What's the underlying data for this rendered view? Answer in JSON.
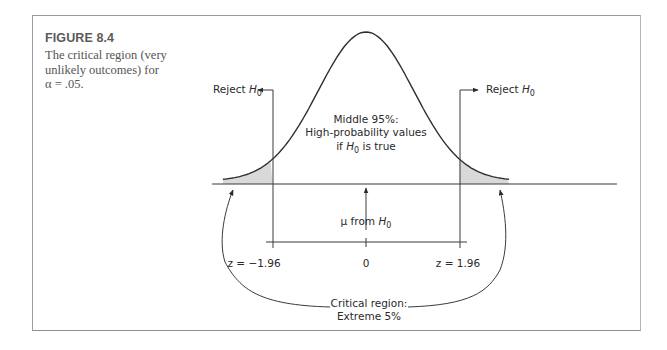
{
  "figure": {
    "number": "FIGURE 8.4",
    "caption_lines": [
      "The critical region (very",
      "unlikely outcomes) for",
      "α = .05."
    ]
  },
  "labels": {
    "reject_left": "Reject ",
    "reject_right": "Reject ",
    "h": "H",
    "sub0": "0",
    "middle_line1": "Middle 95%:",
    "middle_line2": "High-probability values",
    "middle_line3_pre": "if ",
    "middle_line3_post": " is true",
    "mu_pre": "μ from ",
    "z_left": "z = −1.96",
    "zero": "0",
    "z_right": "z = 1.96",
    "critical_line1": "Critical region:",
    "critical_line2": "Extreme 5%"
  },
  "colors": {
    "curve": "#2f2f2f",
    "shade": "#d9d9d9",
    "axis": "#3a3a3a"
  },
  "chart_data": {
    "type": "area",
    "title": "The critical region (very unlikely outcomes) for α = .05",
    "distribution": "standard normal",
    "mean": 0,
    "critical_values": [
      -1.96,
      1.96
    ],
    "alpha": 0.05,
    "tick_labels": [
      "z = −1.96",
      "0",
      "z = 1.96"
    ],
    "regions": [
      {
        "name": "Reject H0 (left tail)",
        "range": [
          -3.0,
          -1.96
        ],
        "shaded": true
      },
      {
        "name": "Middle 95%: High-probability values if H0 is true",
        "range": [
          -1.96,
          1.96
        ],
        "shaded": false
      },
      {
        "name": "Reject H0 (right tail)",
        "range": [
          1.96,
          3.0
        ],
        "shaded": true
      }
    ],
    "annotations": [
      "Reject H0",
      "Middle 95%: High-probability values if H0 is true",
      "μ from H0",
      "Critical region: Extreme 5%"
    ],
    "xlim": [
      -3.0,
      3.0
    ]
  }
}
